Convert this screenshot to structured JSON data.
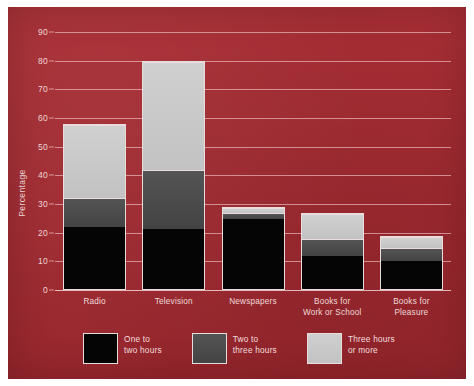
{
  "colors": {
    "background": "#a32b33",
    "page_border": "#ffffff",
    "grid": "#ffe2e2",
    "text": "#f0d9d9",
    "one_to_two": "#050505",
    "two_to_three": "#4a4a4a",
    "three_or_more": "#c9c9c9"
  },
  "chart_data": {
    "type": "bar",
    "stacked": true,
    "title": "",
    "xlabel": "",
    "ylabel": "Percentage",
    "ylim": [
      0,
      90
    ],
    "yticks": [
      0,
      10,
      20,
      30,
      40,
      50,
      60,
      70,
      80,
      90
    ],
    "grid": true,
    "legend_position": "bottom",
    "categories": [
      "Radio",
      "Television",
      "Newspapers",
      "Books for\nWork or School",
      "Books for\nPleasure"
    ],
    "series": [
      {
        "name": "One to\ntwo hours",
        "label": "One to two hours",
        "color": "#050505",
        "values": [
          22,
          21,
          25,
          12,
          10
        ]
      },
      {
        "name": "Two to\nthree hours",
        "label": "Two to three hours",
        "color": "#4a4a4a",
        "values": [
          10,
          21,
          2,
          6,
          5
        ]
      },
      {
        "name": "Three hours\nor more",
        "label": "Three hours or more",
        "color": "#c9c9c9",
        "values": [
          26,
          38,
          2,
          9,
          4
        ]
      }
    ],
    "totals": [
      58,
      80,
      29,
      27,
      19
    ]
  }
}
